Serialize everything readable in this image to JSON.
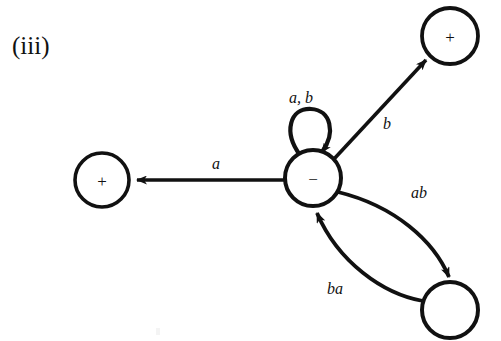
{
  "figure": {
    "label": "(iii)",
    "background_color": "#ffffff",
    "ink_color": "#111111",
    "width": 501,
    "height": 341
  },
  "diagram": {
    "type": "state-transition-diagram",
    "states": [
      {
        "id": "left-accept",
        "symbol": "+",
        "cx": 102,
        "cy": 180,
        "r": 27
      },
      {
        "id": "center-reject",
        "symbol": "−",
        "cx": 313,
        "cy": 178,
        "r": 28
      },
      {
        "id": "top-accept",
        "symbol": "+",
        "cx": 450,
        "cy": 36,
        "r": 28
      },
      {
        "id": "bottom-plain",
        "symbol": "",
        "cx": 450,
        "cy": 310,
        "r": 28
      }
    ],
    "transitions": [
      {
        "id": "center-to-left",
        "label": "a",
        "from": "center-reject",
        "to": "left-accept",
        "shape": "straight",
        "label_x": 212,
        "label_y": 156
      },
      {
        "id": "center-to-top",
        "label": "b",
        "from": "center-reject",
        "to": "top-accept",
        "shape": "straight",
        "label_x": 383,
        "label_y": 116
      },
      {
        "id": "center-self-loop",
        "label": "a, b",
        "from": "center-reject",
        "to": "center-reject",
        "shape": "self-loop",
        "label_x": 289,
        "label_y": 90
      },
      {
        "id": "center-to-bottom",
        "label": "ab",
        "from": "center-reject",
        "to": "bottom-plain",
        "shape": "curve",
        "label_x": 411,
        "label_y": 185
      },
      {
        "id": "bottom-to-center",
        "label": "ba",
        "from": "bottom-plain",
        "to": "center-reject",
        "shape": "curve",
        "label_x": 327,
        "label_y": 281
      }
    ]
  }
}
